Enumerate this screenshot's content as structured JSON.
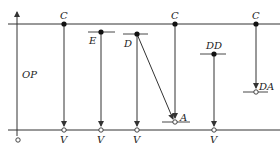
{
  "diagram": {
    "axis_label": "OP",
    "top_line_y": 24,
    "bottom_line_y": 130,
    "colors": {
      "line": "#333333",
      "background": "#ffffff"
    },
    "columns": [
      {
        "id": "c1",
        "top_label": "C",
        "top_dot": [
          64,
          24
        ],
        "end_label": "V",
        "end": [
          64,
          130
        ]
      },
      {
        "id": "e",
        "top_label": "E",
        "top_dot": [
          101,
          32
        ],
        "end_label": "V",
        "end": [
          101,
          130
        ]
      },
      {
        "id": "d",
        "top_label": "D",
        "top_dot": [
          137,
          34
        ],
        "end_label": "V",
        "end": [
          137,
          130
        ]
      },
      {
        "id": "c2",
        "top_label": "C",
        "top_dot": [
          175,
          24
        ],
        "end_label": "A",
        "end": [
          175,
          122
        ]
      },
      {
        "id": "dd",
        "top_label": "DD",
        "top_dot": [
          214,
          54
        ],
        "end_label": "V",
        "end": [
          214,
          130
        ]
      },
      {
        "id": "c3",
        "top_label": "C",
        "top_dot": [
          256,
          24
        ],
        "end_label": "DA",
        "end": [
          256,
          92
        ]
      }
    ],
    "labels": {
      "c1_top": "C",
      "e_top": "E",
      "d_top": "D",
      "c2_top": "C",
      "dd_top": "DD",
      "c3_top": "C",
      "c1_bottom": "V",
      "e_bottom": "V",
      "d_bottom": "V",
      "c2_end": "A",
      "dd_bottom": "V",
      "c3_end": "DA",
      "axis": "OP"
    }
  }
}
